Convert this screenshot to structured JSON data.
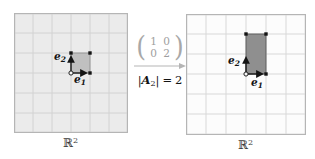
{
  "colors": {
    "left_grid_fill": "#ebebeb",
    "left_grid_line": "#d2d2d2",
    "grid_border": "#b5b5b5",
    "right_grid_fill": "#fcfcfc",
    "right_grid_line": "#d8d8d8",
    "unit_square_fill": "#c0c0c0",
    "transformed_rect_fill": "#8f8f8f",
    "matrix_text": "#9e9e9e",
    "transform_arrow": "#b5b5b5",
    "label_text": "#141414"
  },
  "left_panel": {
    "space_label": {
      "letter": "ℝ",
      "sup": "2"
    },
    "e1_label": {
      "letter": "e",
      "sub": "1"
    },
    "e2_label": {
      "letter": "e",
      "sub": "2"
    }
  },
  "transform": {
    "matrix": {
      "rows": [
        [
          "1",
          "0"
        ],
        [
          "0",
          "2"
        ]
      ]
    },
    "determinant": {
      "lbar": "|",
      "symbol": "A",
      "sub": "2",
      "rbar": "|",
      "eq": "=",
      "value": "2"
    }
  },
  "right_panel": {
    "space_label": {
      "letter": "ℝ",
      "sup": "2"
    },
    "e1_label": {
      "letter": "e",
      "sub": "1"
    },
    "e2_label": {
      "letter": "e",
      "sub": "2"
    }
  }
}
